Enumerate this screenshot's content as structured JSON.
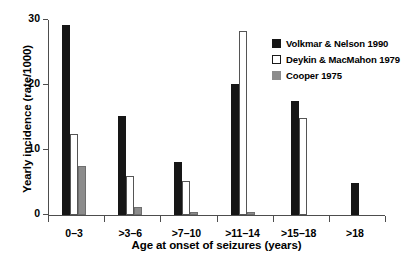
{
  "chart_data": {
    "type": "bar",
    "title": "",
    "xlabel": "Age at onset of seizures (years)",
    "ylabel": "Yearly incidence (rate/1000)",
    "categories": [
      "0–3",
      ">3–6",
      ">7–10",
      ">11–14",
      ">15–18",
      ">18"
    ],
    "series": [
      {
        "name": "Volkmar & Nelson 1990",
        "color": "#161616",
        "style": "filled-black",
        "values": [
          29.3,
          15.2,
          8.2,
          20.2,
          17.5,
          5.0
        ]
      },
      {
        "name": "Deykin & MacMahon 1979",
        "color": "#ffffff",
        "style": "outlined-white",
        "values": [
          12.5,
          6.0,
          5.2,
          28.3,
          15.0,
          0
        ]
      },
      {
        "name": "Cooper 1975",
        "color": "#8c8c8c",
        "style": "filled-gray",
        "values": [
          7.5,
          1.2,
          0.5,
          0.5,
          0,
          0
        ]
      }
    ],
    "ylim": [
      0,
      30
    ],
    "yticks": [
      0,
      10,
      20,
      30
    ],
    "ytick_labels": [
      "0",
      "10",
      "20",
      "30"
    ],
    "grid": false,
    "legend_position": "top-right"
  },
  "legend": {
    "entries": [
      {
        "label": "Volkmar & Nelson 1990",
        "swatch": "black-square"
      },
      {
        "label": "Deykin & MacMahon 1979",
        "swatch": "white-square"
      },
      {
        "label": "Cooper 1975",
        "swatch": "gray-square"
      }
    ]
  }
}
